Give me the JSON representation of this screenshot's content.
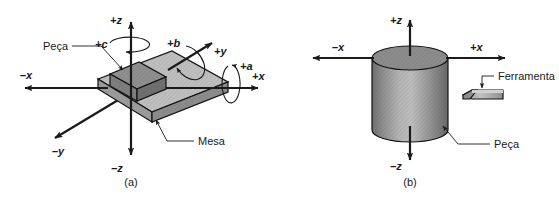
{
  "figure": {
    "language": "pt-BR",
    "background_color": "#ffffff",
    "line_color": "#1a1a1a"
  },
  "colors": {
    "table_top": "#bfbfbf",
    "table_side": "#8a8a8a",
    "table_front": "#9a9a9a",
    "workpiece_top": "#8f8f8f",
    "workpiece_side": "#6e6e6e",
    "workpiece_front": "#7d7d7d",
    "cylinder_top": "#8c8c8c",
    "cylinder_body_light": "#b8b8b8",
    "cylinder_body_dark": "#6a6a6a",
    "tool_body": "#b0b0b0",
    "tool_dark": "#7a7a7a",
    "outline": "#111111"
  },
  "panel_a": {
    "caption": "(a)",
    "axes": [
      {
        "name": "plus-z",
        "label": "+z"
      },
      {
        "name": "minus-z",
        "label": "–z"
      },
      {
        "name": "plus-x",
        "label": "+x"
      },
      {
        "name": "minus-x",
        "label": "–x"
      },
      {
        "name": "plus-y",
        "label": "+y"
      },
      {
        "name": "minus-y",
        "label": "–y"
      }
    ],
    "rotations": [
      {
        "name": "rotation-a",
        "label": "+a",
        "about_axis": "+x"
      },
      {
        "name": "rotation-b",
        "label": "+b",
        "about_axis": "+y"
      },
      {
        "name": "rotation-c",
        "label": "+c",
        "about_axis": "+z"
      }
    ],
    "callouts": [
      {
        "name": "workpiece",
        "label": "Peça"
      },
      {
        "name": "table",
        "label": "Mesa"
      }
    ]
  },
  "panel_b": {
    "caption": "(b)",
    "axes": [
      {
        "name": "plus-z",
        "label": "+z"
      },
      {
        "name": "minus-z",
        "label": "–z"
      },
      {
        "name": "plus-x",
        "label": "+x"
      },
      {
        "name": "minus-x",
        "label": "–x"
      }
    ],
    "callouts": [
      {
        "name": "tool",
        "label": "Ferramenta"
      },
      {
        "name": "workpiece",
        "label": "Peça"
      }
    ]
  }
}
